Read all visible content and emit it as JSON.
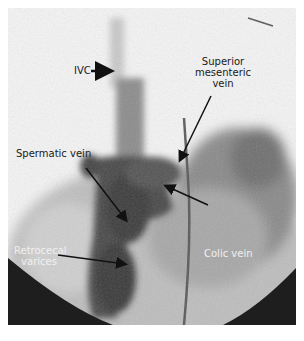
{
  "figure": {
    "type": "angiogram",
    "labels": {
      "ivc": "IVC",
      "smv_line1": "Superior",
      "smv_line2": "mesenteric",
      "smv_line3": "vein",
      "spermatic": "Spermatic vein",
      "colic": "Colic vein",
      "retro_line1": "Retrocecal",
      "retro_line2": "varices"
    }
  }
}
